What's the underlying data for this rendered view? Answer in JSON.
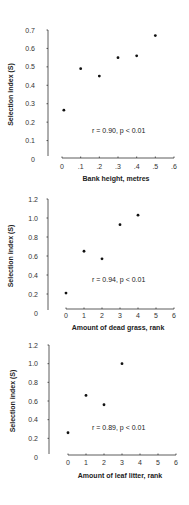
{
  "chart_data": [
    {
      "type": "scatter",
      "title": "",
      "xlabel": "Bank height, metres",
      "ylabel": "Selection index (S)",
      "x_ticks": [
        "0",
        ".1",
        ".2",
        ".3",
        ".4",
        ".5",
        ".6"
      ],
      "y_ticks": [
        "0",
        "0.1",
        "0.2",
        "0.3",
        "0.4",
        "0.5",
        "0.6",
        "0.7"
      ],
      "xlim": [
        0,
        0.6
      ],
      "ylim": [
        0,
        0.7
      ],
      "grid": false,
      "x": [
        0.01,
        0.1,
        0.2,
        0.3,
        0.4,
        0.5
      ],
      "y": [
        0.265,
        0.49,
        0.45,
        0.55,
        0.56,
        0.67
      ],
      "annotation": "r = 0.90, p < 0.01"
    },
    {
      "type": "scatter",
      "title": "",
      "xlabel": "Amount of dead grass, rank",
      "ylabel": "Selection index (S)",
      "x_ticks": [
        "0",
        "1",
        "2",
        "3",
        "4",
        "5",
        "6"
      ],
      "y_ticks": [
        "0",
        "0.2",
        "0.4",
        "0.6",
        "0.8",
        "1.0",
        "1.2"
      ],
      "xlim": [
        0,
        6
      ],
      "ylim": [
        0,
        1.2
      ],
      "grid": false,
      "x": [
        0,
        1,
        2,
        3,
        4
      ],
      "y": [
        0.21,
        0.65,
        0.57,
        0.93,
        1.03
      ],
      "annotation": "r = 0.94, p < 0.01"
    },
    {
      "type": "scatter",
      "title": "",
      "xlabel": "Amount of leaf litter, rank",
      "ylabel": "Selection index (S)",
      "x_ticks": [
        "0",
        "1",
        "2",
        "3",
        "4",
        "5",
        "6"
      ],
      "y_ticks": [
        "0",
        "0.2",
        "0.4",
        "0.6",
        "0.8",
        "1.0",
        "1.2"
      ],
      "xlim": [
        0,
        6
      ],
      "ylim": [
        0,
        1.2
      ],
      "grid": false,
      "x": [
        0,
        1,
        2,
        3
      ],
      "y": [
        0.26,
        0.66,
        0.56,
        1.0
      ],
      "annotation": "r = 0.89, p < 0.01"
    }
  ]
}
